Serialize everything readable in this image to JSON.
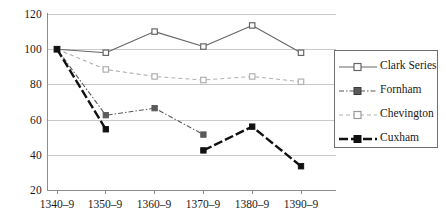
{
  "chart_data": {
    "type": "line",
    "title": "",
    "subtitle": "",
    "xlabel": "",
    "ylabel": "",
    "categories": [
      "1340–9",
      "1350–9",
      "1360–9",
      "1370–9",
      "1380–9",
      "1390–9"
    ],
    "ylim": [
      20,
      120
    ],
    "yticks": [
      20,
      40,
      60,
      80,
      100,
      120
    ],
    "ytick_labels": [
      "20",
      "40",
      "60",
      "80",
      "100",
      "120"
    ],
    "grid": "horizontal",
    "legend_position": "right",
    "series": [
      {
        "name": "Clark Series",
        "values": [
          100,
          98,
          110,
          101.5,
          113.5,
          98
        ],
        "color": "#666666",
        "line_style": "solid",
        "marker": "open-square",
        "line_width": 1.1
      },
      {
        "name": "Fornham",
        "values": [
          100,
          62.5,
          66.5,
          51.5,
          null,
          null
        ],
        "color": "#5a5a5a",
        "line_style": "dash-dot",
        "marker": "filled-square",
        "line_width": 1.1
      },
      {
        "name": "Chevington",
        "values": [
          100,
          88.5,
          84.5,
          82.5,
          84.5,
          81.5
        ],
        "color": "#b0b0b0",
        "line_style": "dashed",
        "marker": "open-square",
        "line_width": 1.1
      },
      {
        "name": "Cuxham",
        "values": [
          100,
          54.5,
          null,
          42.5,
          56,
          33.5
        ],
        "color": "#111111",
        "line_style": "dashed-thick",
        "marker": "filled-square",
        "line_width": 2.4
      }
    ]
  },
  "legend": {
    "entries": [
      {
        "label": "Clark Series"
      },
      {
        "label": "Fornham"
      },
      {
        "label": "Chevington"
      },
      {
        "label": "Cuxham"
      }
    ]
  },
  "axes": {
    "y_labels": [
      "120",
      "100",
      "80",
      "60",
      "40",
      "20"
    ],
    "x_labels": [
      "1340–9",
      "1350–9",
      "1360–9",
      "1370–9",
      "1380–9",
      "1390–9"
    ]
  },
  "colors": {
    "grid": "#c9c9c9",
    "axis": "#8d8d8d",
    "text": "#1a1a1a",
    "background": "#ffffff",
    "legend_border": "#6f6f6f"
  }
}
